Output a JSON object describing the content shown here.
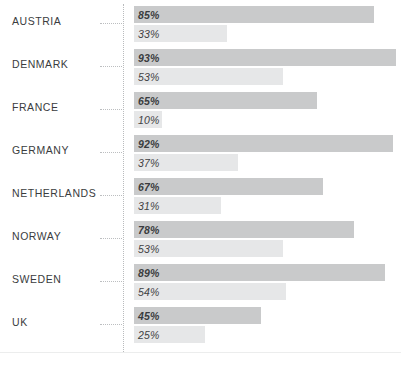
{
  "chart_data": {
    "type": "bar",
    "orientation": "horizontal",
    "title": "",
    "subtitle": "",
    "xlabel": "",
    "ylabel": "",
    "xlim": [
      0,
      100
    ],
    "grid": false,
    "legend_position": "none",
    "categories": [
      "AUSTRIA",
      "DENMARK",
      "FRANCE",
      "GERMANY",
      "NETHERLANDS",
      "NORWAY",
      "SWEDEN",
      "UK"
    ],
    "series": [
      {
        "name": "top",
        "color": "#c9cacb",
        "values": [
          85,
          93,
          65,
          92,
          67,
          78,
          89,
          45
        ]
      },
      {
        "name": "bottom",
        "color": "#e6e7e8",
        "values": [
          33,
          53,
          10,
          37,
          31,
          53,
          54,
          25
        ]
      }
    ],
    "value_suffix": "%"
  },
  "groups": [
    {
      "label": "AUSTRIA",
      "top": {
        "value": 85,
        "text": "85%"
      },
      "bottom": {
        "value": 33,
        "text": "33%"
      }
    },
    {
      "label": "DENMARK",
      "top": {
        "value": 93,
        "text": "93%"
      },
      "bottom": {
        "value": 53,
        "text": "53%"
      }
    },
    {
      "label": "FRANCE",
      "top": {
        "value": 65,
        "text": "65%"
      },
      "bottom": {
        "value": 10,
        "text": "10%"
      }
    },
    {
      "label": "GERMANY",
      "top": {
        "value": 92,
        "text": "92%"
      },
      "bottom": {
        "value": 37,
        "text": "37%"
      }
    },
    {
      "label": "NETHERLANDS",
      "top": {
        "value": 67,
        "text": "67%"
      },
      "bottom": {
        "value": 31,
        "text": "31%"
      }
    },
    {
      "label": "NORWAY",
      "top": {
        "value": 78,
        "text": "78%"
      },
      "bottom": {
        "value": 53,
        "text": "53%"
      }
    },
    {
      "label": "SWEDEN",
      "top": {
        "value": 89,
        "text": "89%"
      },
      "bottom": {
        "value": 54,
        "text": "54%"
      }
    },
    {
      "label": "UK",
      "top": {
        "value": 45,
        "text": "45%"
      },
      "bottom": {
        "value": 25,
        "text": "25%"
      }
    }
  ],
  "layout": {
    "bar_origin_x": 134,
    "px_per_percent": 2.82,
    "row_height": 43,
    "first_row_top": 6,
    "colors": {
      "bar_top": "#c9cacb",
      "bar_bottom": "#e6e7e8",
      "text": "#3a3c3e",
      "axis_dotted": "#b9bbbd",
      "baseline": "#eceded",
      "background": "#ffffff"
    }
  }
}
